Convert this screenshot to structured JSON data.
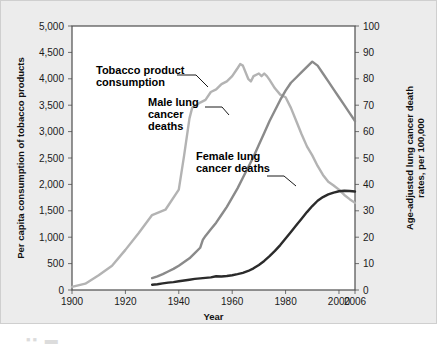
{
  "figure": {
    "background_color": "#ececec",
    "plot_background_color": "#ffffff",
    "border_color": "#cfcfcf"
  },
  "chart_data": {
    "type": "line",
    "title": "",
    "xlabel": "Year",
    "ylabel": "Per capita consumption of tobacco products",
    "y2label": "Age-adjusted lung cancer death rates, per 100,000",
    "xlim": [
      1900,
      2006
    ],
    "ylim": [
      0,
      5000
    ],
    "y2lim": [
      0,
      100
    ],
    "grid": false,
    "legend_position": "inline-annotations",
    "xticks": [
      1900,
      1920,
      1940,
      1960,
      1980,
      2000,
      2006
    ],
    "xtick_labels": [
      "1900",
      "1920",
      "1940",
      "1960",
      "1980",
      "2000",
      "2006"
    ],
    "yticks": [
      0,
      500,
      1000,
      1500,
      2000,
      2500,
      3000,
      3500,
      4000,
      4500,
      5000
    ],
    "ytick_labels": [
      "0",
      "500",
      "1,000",
      "1,500",
      "2,000",
      "2,500",
      "3,000",
      "3,500",
      "4,000",
      "4,500",
      "5,000"
    ],
    "y2ticks": [
      0,
      10,
      20,
      30,
      40,
      50,
      60,
      70,
      80,
      90,
      100
    ],
    "y2tick_labels": [
      "0",
      "10",
      "20",
      "30",
      "40",
      "50",
      "60",
      "70",
      "80",
      "90",
      "100"
    ],
    "series": [
      {
        "name": "Tobacco product consumption",
        "axis": "left",
        "color": "#b3b3b3",
        "linewidth": 2.4,
        "x": [
          1900,
          1905,
          1910,
          1915,
          1920,
          1925,
          1930,
          1935,
          1940,
          1942,
          1944,
          1945,
          1948,
          1950,
          1952,
          1954,
          1956,
          1958,
          1960,
          1962,
          1963,
          1964,
          1966,
          1967,
          1968,
          1970,
          1971,
          1972,
          1973,
          1974,
          1976,
          1978,
          1980,
          1982,
          1984,
          1986,
          1988,
          1990,
          1992,
          1994,
          1996,
          1998,
          2000,
          2002,
          2004,
          2006
        ],
        "y": [
          60,
          120,
          280,
          460,
          760,
          1080,
          1420,
          1520,
          1900,
          2550,
          3250,
          3450,
          3550,
          3600,
          3750,
          3800,
          3900,
          3950,
          4050,
          4200,
          4280,
          4250,
          4000,
          3950,
          4050,
          4100,
          4050,
          4100,
          4050,
          3980,
          3820,
          3700,
          3650,
          3450,
          3200,
          2950,
          2720,
          2550,
          2350,
          2180,
          2050,
          1980,
          1900,
          1800,
          1720,
          1650
        ]
      },
      {
        "name": "Male lung cancer deaths",
        "axis": "right",
        "color": "#8a8a8a",
        "linewidth": 2.4,
        "x": [
          1930,
          1932,
          1934,
          1936,
          1938,
          1940,
          1942,
          1944,
          1946,
          1948,
          1949,
          1950,
          1952,
          1954,
          1956,
          1958,
          1960,
          1962,
          1964,
          1966,
          1968,
          1970,
          1972,
          1974,
          1976,
          1978,
          1980,
          1982,
          1984,
          1986,
          1988,
          1990,
          1992,
          1994,
          1996,
          1998,
          2000,
          2002,
          2004,
          2006
        ],
        "y": [
          4.5,
          5.2,
          6.0,
          7.0,
          8.0,
          9.2,
          10.6,
          12.0,
          14.0,
          16.0,
          19.0,
          20.5,
          23.0,
          25.5,
          28.5,
          31.5,
          35.0,
          38.5,
          42.5,
          46.5,
          50.5,
          55.0,
          59.5,
          64.0,
          68.0,
          72.0,
          75.5,
          78.5,
          80.5,
          82.5,
          84.5,
          86.5,
          85.0,
          82.0,
          79.0,
          76.0,
          73.0,
          70.0,
          67.0,
          64.0
        ]
      },
      {
        "name": "Female lung cancer deaths",
        "axis": "right",
        "color": "#2b2b2b",
        "linewidth": 2.4,
        "x": [
          1930,
          1932,
          1934,
          1936,
          1938,
          1940,
          1942,
          1944,
          1946,
          1948,
          1950,
          1952,
          1954,
          1956,
          1958,
          1960,
          1962,
          1964,
          1966,
          1968,
          1970,
          1972,
          1974,
          1976,
          1978,
          1980,
          1982,
          1984,
          1986,
          1988,
          1990,
          1992,
          1994,
          1996,
          1998,
          2000,
          2002,
          2004,
          2006
        ],
        "y": [
          2.0,
          2.2,
          2.5,
          2.8,
          3.0,
          3.3,
          3.6,
          3.9,
          4.2,
          4.4,
          4.6,
          4.8,
          5.2,
          5.1,
          5.3,
          5.6,
          6.0,
          6.5,
          7.2,
          8.2,
          9.5,
          11.0,
          12.8,
          14.8,
          17.0,
          19.5,
          22.0,
          24.5,
          27.0,
          29.5,
          31.8,
          33.8,
          35.2,
          36.2,
          36.9,
          37.4,
          37.6,
          37.5,
          37.3
        ]
      }
    ],
    "annotations": [
      {
        "id": "tobacco",
        "lines": [
          "Tobacco product",
          "consumption"
        ],
        "text_x": 96,
        "text_y": 74,
        "leader": [
          [
            177,
            75
          ],
          [
            196,
            75
          ],
          [
            208,
            87
          ]
        ]
      },
      {
        "id": "male",
        "lines": [
          "Male lung",
          "cancer",
          "deaths"
        ],
        "text_x": 148,
        "text_y": 106,
        "leader": [
          [
            205,
            107
          ],
          [
            222,
            107
          ],
          [
            229,
            115
          ]
        ]
      },
      {
        "id": "female",
        "lines": [
          "Female lung",
          "cancer deaths"
        ],
        "text_x": 196,
        "text_y": 160,
        "leader": [
          [
            267,
            176
          ],
          [
            284,
            176
          ],
          [
            296,
            186
          ]
        ]
      }
    ]
  }
}
